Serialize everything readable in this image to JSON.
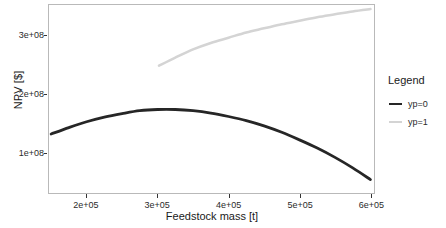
{
  "chart_data": {
    "type": "line",
    "title": "",
    "xlabel": "Feedstock mass [t]",
    "ylabel": "NPV [$]",
    "xlim": [
      147000,
      605000
    ],
    "ylim": [
      30000000,
      352000000
    ],
    "grid": false,
    "legend_position": "right",
    "legend_title": "Legend",
    "xticks": [
      {
        "value": 200000,
        "label": "2e+05"
      },
      {
        "value": 300000,
        "label": "3e+05"
      },
      {
        "value": 400000,
        "label": "4e+05"
      },
      {
        "value": 500000,
        "label": "5e+05"
      },
      {
        "value": 600000,
        "label": "6e+05"
      }
    ],
    "yticks": [
      {
        "value": 100000000,
        "label": "1e+08"
      },
      {
        "value": 200000000,
        "label": "2e+08"
      },
      {
        "value": 300000000,
        "label": "3e+08"
      }
    ],
    "series": [
      {
        "name": "yp=0",
        "color": "#262626",
        "x": [
          150000,
          175000,
          200000,
          225000,
          250000,
          275000,
          300000,
          325000,
          350000,
          375000,
          400000,
          425000,
          450000,
          475000,
          500000,
          525000,
          550000,
          575000,
          600000
        ],
        "values": [
          131000000,
          142000000,
          152000000,
          160000000,
          166000000,
          171000000,
          173000000,
          173000000,
          171000000,
          167000000,
          161000000,
          154000000,
          145000000,
          134000000,
          121000000,
          107000000,
          91000000,
          73000000,
          53000000
        ]
      },
      {
        "name": "yp=1",
        "color": "#d4d4d4",
        "x": [
          302000,
          325000,
          350000,
          375000,
          400000,
          425000,
          450000,
          475000,
          500000,
          525000,
          550000,
          575000,
          600000
        ],
        "values": [
          248000000,
          262000000,
          276000000,
          287000000,
          296000000,
          305000000,
          312000000,
          319000000,
          325000000,
          331000000,
          336000000,
          341000000,
          345000000
        ]
      }
    ]
  },
  "legend": {
    "title": "Legend",
    "items": [
      {
        "label": "yp=0",
        "color": "#262626"
      },
      {
        "label": "yp=1",
        "color": "#d4d4d4"
      }
    ]
  }
}
